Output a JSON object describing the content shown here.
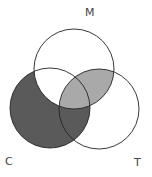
{
  "diagram": {
    "type": "venn",
    "sets": [
      {
        "label": "M",
        "cx": 74,
        "cy": 69,
        "r": 40
      },
      {
        "label": "C",
        "cx": 50,
        "cy": 108,
        "r": 40
      },
      {
        "label": "T",
        "cx": 99,
        "cy": 109,
        "r": 40
      }
    ],
    "shaded_regions": [
      {
        "region": "C minus M",
        "color": "#5a5a5a"
      },
      {
        "region": "M intersect T",
        "color": "#a9a9a9"
      }
    ],
    "labels": {
      "m": "M",
      "c": "C",
      "t": "T"
    }
  }
}
